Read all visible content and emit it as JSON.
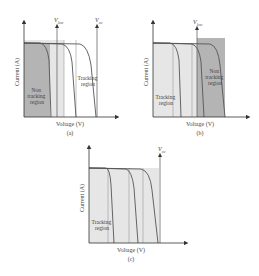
{
  "figure": {
    "panels": [
      {
        "id": "a",
        "caption": "(a)",
        "xlabel": "Voltage (V)",
        "ylabel": "Current (A)",
        "markers": [
          {
            "symbol": "V",
            "subscript": "low",
            "label": "V_low"
          },
          {
            "symbol": "V",
            "subscript": "oc",
            "label": "V_oc"
          }
        ],
        "regions": [
          {
            "name": "non-tracking",
            "lines": [
              "Non",
              "tracking",
              "region"
            ]
          },
          {
            "name": "tracking",
            "lines": [
              "Tracking",
              "region"
            ]
          }
        ]
      },
      {
        "id": "b",
        "caption": "(b)",
        "xlabel": "Voltage (V)",
        "ylabel": "Current (A)",
        "markers": [
          {
            "symbol": "V",
            "subscript": "low",
            "label": "V_low"
          }
        ],
        "regions": [
          {
            "name": "tracking",
            "lines": [
              "Tracking",
              "region"
            ]
          },
          {
            "name": "non-tracking",
            "lines": [
              "Non",
              "tracking",
              "region"
            ]
          }
        ]
      },
      {
        "id": "c",
        "caption": "(c)",
        "xlabel": "Voltage (V)",
        "ylabel": "Current (A)",
        "markers": [
          {
            "symbol": "V",
            "subscript": "oc",
            "label": "V_oc"
          }
        ],
        "regions": [
          {
            "name": "tracking",
            "lines": [
              "Tracking",
              "region"
            ]
          }
        ]
      }
    ],
    "colors": {
      "curve": "#555555",
      "axis": "#333333",
      "dark_shade": "#b4b4b4",
      "light_shade": "#e6e6e6",
      "guide": "#9a9a9a"
    }
  }
}
